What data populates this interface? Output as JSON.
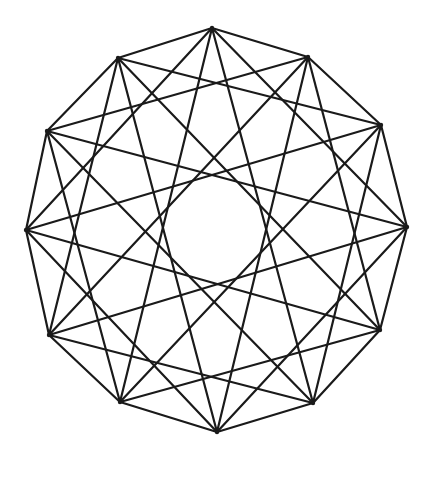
{
  "diagram": {
    "title": "",
    "stroke_color": "#1a1a1a",
    "background": "#ffffff",
    "vertices": [
      [
        212,
        28
      ],
      [
        308,
        57
      ],
      [
        381,
        125
      ],
      [
        407,
        227
      ],
      [
        380,
        330
      ],
      [
        313,
        403
      ],
      [
        217,
        432
      ],
      [
        120,
        402
      ],
      [
        49,
        335
      ],
      [
        26,
        230
      ],
      [
        47,
        131
      ],
      [
        118,
        58
      ]
    ],
    "skips": [
      1,
      3,
      5
    ]
  }
}
